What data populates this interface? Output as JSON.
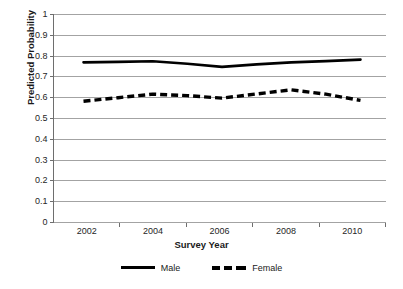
{
  "chart_data": {
    "type": "line",
    "title": "",
    "xlabel": "Survey Year",
    "ylabel": "Predicted Probability",
    "x": [
      2002,
      2003,
      2004,
      2005,
      2006,
      2007,
      2008,
      2009,
      2010
    ],
    "xtick_labels": [
      "2002",
      "2004",
      "2006",
      "2008",
      "2010"
    ],
    "xtick_values": [
      2002,
      2004,
      2006,
      2008,
      2010
    ],
    "ytick_labels": [
      "0",
      "0.1",
      "0.2",
      "0.3",
      "0.4",
      "0.5",
      "0.6",
      "0.7",
      "0.8",
      "0.9",
      "1"
    ],
    "ytick_values": [
      0,
      0.1,
      0.2,
      0.3,
      0.4,
      0.5,
      0.6,
      0.7,
      0.8,
      0.9,
      1
    ],
    "ylim": [
      0,
      1
    ],
    "xlim": [
      2002,
      2010
    ],
    "grid": "horizontal",
    "legend_position": "bottom",
    "series": [
      {
        "name": "Male",
        "style": "solid",
        "color": "#000000",
        "values": [
          0.77,
          0.772,
          0.775,
          0.763,
          0.748,
          0.76,
          0.77,
          0.776,
          0.783
        ]
      },
      {
        "name": "Female",
        "style": "dashed",
        "color": "#000000",
        "values": [
          0.583,
          0.6,
          0.617,
          0.61,
          0.598,
          0.618,
          0.638,
          0.617,
          0.587
        ]
      }
    ]
  }
}
